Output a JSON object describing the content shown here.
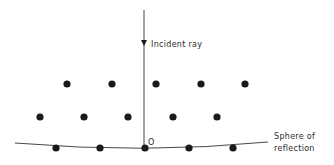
{
  "diagram": {
    "incident_ray_label": "Incident ray",
    "origin_label": "O",
    "sphere_label_line1": "Sphere of",
    "sphere_label_line2": "reflection",
    "colors": {
      "ink": "#1a1a1a",
      "line": "#333333",
      "background": "#ffffff"
    },
    "lattice_rows": [
      {
        "y": 84,
        "x": [
          67,
          112,
          156,
          201,
          245
        ]
      },
      {
        "y": 117,
        "x": [
          40,
          84,
          128,
          173,
          217
        ]
      },
      {
        "y": 148,
        "x": [
          56,
          100,
          145,
          189,
          233
        ]
      }
    ]
  }
}
